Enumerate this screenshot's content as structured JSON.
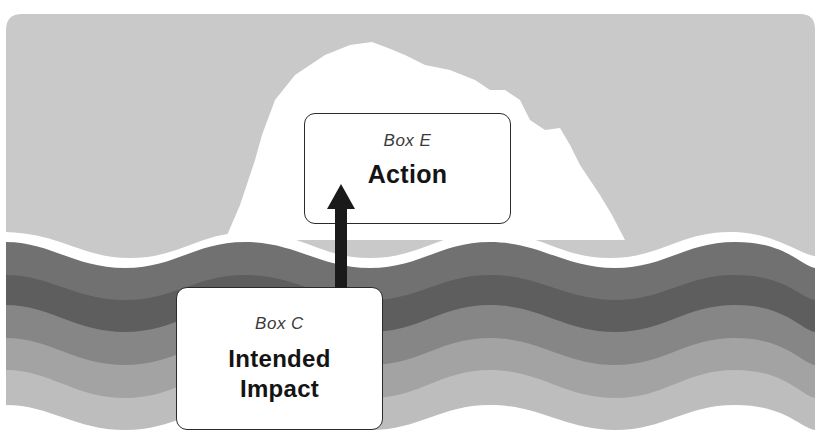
{
  "diagram": {
    "type": "iceberg",
    "colors": {
      "sky": "#c9c9c9",
      "iceberg": "#ffffff",
      "wave_dark": "#6e6e6e",
      "wave_mid_dark": "#5f5f5f",
      "wave_mid": "#8a8a8a",
      "wave_light": "#a8a8a8",
      "wave_lighter": "#c2c2c2",
      "arrow": "#1a1a1a",
      "box_border": "#2b2b2b"
    },
    "boxes": {
      "above_water": {
        "label": "Box E",
        "title": "Action"
      },
      "below_water": {
        "label": "Box C",
        "title_line1": "Intended",
        "title_line2": "Impact"
      }
    },
    "arrow": {
      "direction": "up",
      "from": "Box C",
      "to": "Box E"
    }
  }
}
